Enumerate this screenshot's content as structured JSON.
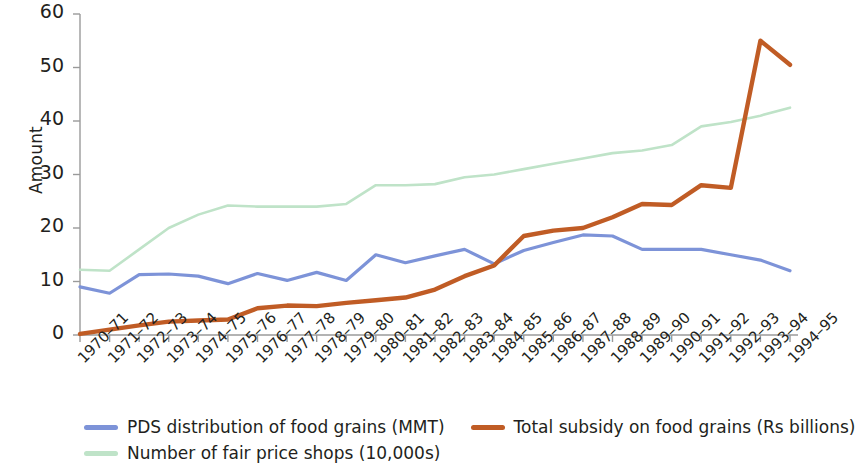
{
  "chart_data": {
    "type": "line",
    "title": "",
    "xlabel": "",
    "ylabel": "Amount",
    "ylim": [
      0,
      60
    ],
    "yticks": [
      0,
      10,
      20,
      30,
      40,
      50,
      60
    ],
    "grid": false,
    "legend_position": "bottom-left",
    "categories": [
      "1970–71",
      "1971–72",
      "1972–73",
      "1973–74",
      "1974–75",
      "1975–76",
      "1976–77",
      "1977–78",
      "1978–79",
      "1979–80",
      "1980–81",
      "1981–82",
      "1982–83",
      "1983–84",
      "1984–85",
      "1985–86",
      "1986–87",
      "1987–88",
      "1988–89",
      "1989–90",
      "1990–91",
      "1991–92",
      "1992–93",
      "1993–94",
      "1994–95"
    ],
    "series": [
      {
        "name": "PDS distribution of food grains (MMT)",
        "color": "#7d93d8",
        "values": [
          9.0,
          7.8,
          11.3,
          11.4,
          11.0,
          9.6,
          11.5,
          10.2,
          11.7,
          10.2,
          15.0,
          13.5,
          14.8,
          16.0,
          13.3,
          15.8,
          17.3,
          18.7,
          18.5,
          16.0,
          16.0,
          16.0,
          15.0,
          14.0,
          12.0
        ]
      },
      {
        "name": "Total subsidy on food grains (Rs billions)",
        "color": "#c05c25",
        "values": [
          0.2,
          1.0,
          1.8,
          2.5,
          2.7,
          2.9,
          5.0,
          5.5,
          5.4,
          6.0,
          6.5,
          7.0,
          8.5,
          11.0,
          13.0,
          18.5,
          19.5,
          20.0,
          22.0,
          24.5,
          24.3,
          28.0,
          27.5,
          55.0,
          50.5
        ]
      },
      {
        "name": "Number of fair price shops (10,000s)",
        "color": "#bfe3c8",
        "values": [
          12.2,
          12.0,
          16.0,
          20.0,
          22.5,
          24.2,
          24.0,
          24.0,
          24.0,
          24.5,
          28.0,
          28.0,
          28.2,
          29.5,
          30.0,
          31.0,
          32.0,
          33.0,
          34.0,
          34.5,
          35.5,
          39.0,
          39.8,
          41.0,
          42.5
        ]
      }
    ]
  },
  "axes": {
    "y_title": "Amount"
  },
  "legend": {
    "entries": [
      {
        "label": "PDS distribution of food grains (MMT)",
        "color": "#7d93d8"
      },
      {
        "label": "Total subsidy on food grains (Rs billions)",
        "color": "#c05c25"
      },
      {
        "label": "Number of fair price shops (10,000s)",
        "color": "#bfe3c8"
      }
    ]
  }
}
